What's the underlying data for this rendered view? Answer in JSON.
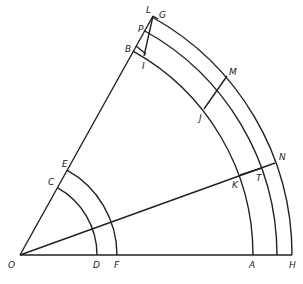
{
  "figure": {
    "origin": {
      "label": "O",
      "x": 20,
      "y": 255
    },
    "upper_ray_angle_deg": 61,
    "middle_ray_angle_deg": 19.8,
    "arc_radii": {
      "D": 77,
      "F": 97,
      "A": 233,
      "middle": 257,
      "H": 272
    },
    "labels": {
      "O": "O",
      "D": "D",
      "F": "F",
      "A": "A",
      "H": "H",
      "C": "C",
      "E": "E",
      "B": "B",
      "I": "I",
      "P": "P",
      "L": "L",
      "G": "G",
      "M": "M",
      "J": "J",
      "N": "N",
      "K": "K",
      "T": "T"
    }
  }
}
